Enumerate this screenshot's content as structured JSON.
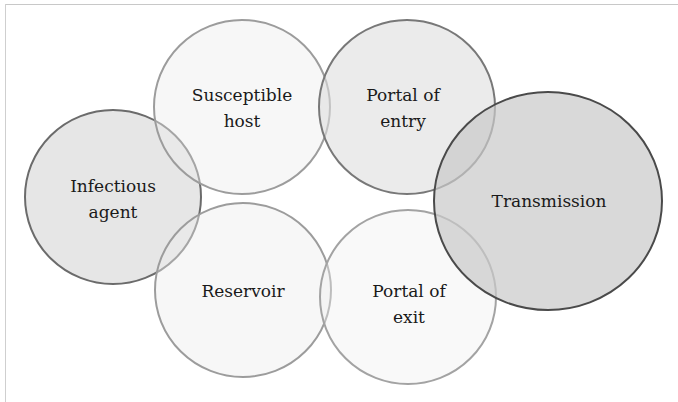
{
  "diagram": {
    "nodes": [
      {
        "id": "infectious-agent",
        "lines": [
          "Infectious",
          "agent"
        ],
        "cx": 113,
        "cy": 197,
        "rx": 88,
        "ry": 87,
        "fill": "#e6e6e6",
        "stroke": "#6b6b6b"
      },
      {
        "id": "susceptible-host",
        "lines": [
          "Susceptible",
          "host"
        ],
        "cx": 242,
        "cy": 107,
        "rx": 88,
        "ry": 87,
        "fill": "#f8f8f8",
        "stroke": "#9c9c9c"
      },
      {
        "id": "portal-of-entry",
        "lines": [
          "Portal of",
          "entry"
        ],
        "cx": 407,
        "cy": 107,
        "rx": 88,
        "ry": 87,
        "fill": "#ededed",
        "stroke": "#787878"
      },
      {
        "id": "transmission",
        "lines": [
          "Transmission"
        ],
        "cx": 548,
        "cy": 201,
        "rx": 114,
        "ry": 109,
        "fill": "#dcdcdc",
        "stroke": "#4a4a4a"
      },
      {
        "id": "reservoir",
        "lines": [
          "Reservoir"
        ],
        "cx": 243,
        "cy": 290,
        "rx": 88,
        "ry": 87,
        "fill": "#f8f8f8",
        "stroke": "#9c9c9c"
      },
      {
        "id": "portal-of-exit",
        "lines": [
          "Portal of",
          "exit"
        ],
        "cx": 408,
        "cy": 297,
        "rx": 88,
        "ry": 87,
        "fill": "#fafafa",
        "stroke": "#a3a3a3"
      }
    ]
  },
  "labels": {
    "infectious_agent_1": "Infectious",
    "infectious_agent_2": "agent",
    "susceptible_host_1": "Susceptible",
    "susceptible_host_2": "host",
    "portal_of_entry_1": "Portal of",
    "portal_of_entry_2": "entry",
    "transmission": "Transmission",
    "reservoir": "Reservoir",
    "portal_of_exit_1": "Portal of",
    "portal_of_exit_2": "exit"
  },
  "colors": {
    "background": "#ffffff",
    "frame_line": "#c8c8c8",
    "text": "#1a1a1a"
  }
}
